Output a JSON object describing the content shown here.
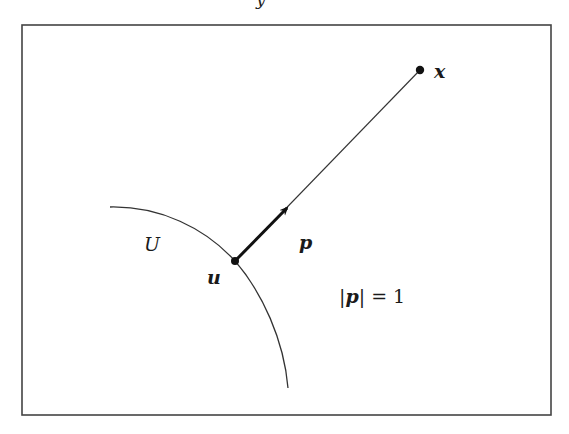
{
  "figure": {
    "top_fragment_text": "y",
    "frame": {
      "x": 22,
      "y": 25,
      "width": 529,
      "height": 390,
      "stroke": "#444444"
    },
    "boundary_curve": {
      "label": "U",
      "start": [
        110,
        207
      ],
      "control": [
        198,
        210
      ],
      "through": [
        235,
        261
      ],
      "end": [
        288,
        388
      ],
      "stroke": "#333333"
    },
    "points": {
      "u": {
        "label": "u",
        "x": 235,
        "y": 261
      },
      "x": {
        "label": "x",
        "x": 420,
        "y": 70
      }
    },
    "segment": {
      "from": "u",
      "to": "x",
      "stroke": "#333333"
    },
    "vector": {
      "label": "p",
      "from": [
        235,
        261
      ],
      "to": [
        289,
        206
      ],
      "stroke": "#111111"
    },
    "annotation": {
      "text_parts": [
        "|",
        "p",
        "| = 1"
      ]
    },
    "colors": {
      "ink": "#1a1a1a",
      "background": "#ffffff"
    }
  }
}
